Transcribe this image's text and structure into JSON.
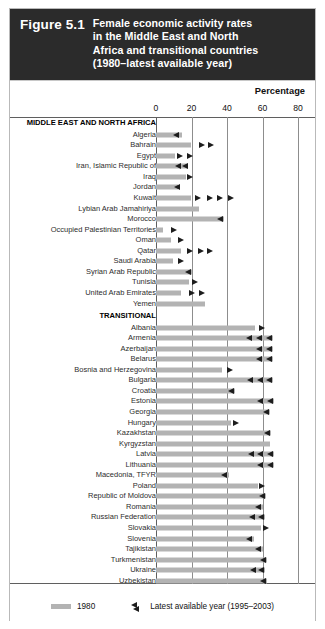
{
  "figure": {
    "number": "Figure 5.1",
    "title_lines": [
      "Female economic activity rates",
      "in the Middle East and North",
      "Africa and transitional countries",
      "(1980–latest available year)"
    ]
  },
  "axis": {
    "unit_label": "Percentage",
    "ticks": [
      "0",
      "20",
      "40",
      "60",
      "80"
    ]
  },
  "legend": {
    "bar_label": "1980",
    "marker_label": "Latest available year (1995–2003)"
  },
  "colors": {
    "header_bg": "#2b2b2b",
    "header_text": "#ffffff",
    "bar_1980": "#b3b3b3",
    "marker_latest": "#1d1d1d",
    "gridline": "#8d8d8d",
    "axis": "#5f5f5f",
    "page_bg": "#ffffff"
  },
  "chart_data": {
    "type": "bar",
    "title": "Female economic activity rates in the Middle East and North Africa and transitional countries (1980–latest available year)",
    "xlabel": "Percentage",
    "ylabel": "",
    "xlim": [
      0,
      80
    ],
    "xticks": [
      0,
      20,
      40,
      60,
      80
    ],
    "grid": true,
    "orientation": "horizontal",
    "legend_position": "bottom",
    "series": [
      {
        "name": "1980",
        "style": "bar",
        "color": "#b3b3b3"
      },
      {
        "name": "Latest available year (1995–2003)",
        "style": "triangle-marker",
        "color": "#1d1d1d"
      }
    ],
    "groups": [
      {
        "name": "MIDDLE EAST AND NORTH AFRICA",
        "rows": [
          {
            "label": "Algeria",
            "bar_1980": 14.5,
            "markers": [
              {
                "value": 13.0,
                "dir": "left"
              }
            ]
          },
          {
            "label": "Bahrain",
            "bar_1980": 19.5,
            "markers": [
              {
                "value": 24.0,
                "dir": "right"
              },
              {
                "value": 29.5,
                "dir": "right"
              }
            ]
          },
          {
            "label": "Egypt",
            "bar_1980": 10.5,
            "markers": [
              {
                "value": 12.0,
                "dir": "right"
              },
              {
                "value": 17.5,
                "dir": "right"
              }
            ]
          },
          {
            "label": "Iran, Islamic Republic of",
            "bar_1980": 18.0,
            "markers": [
              {
                "value": 14.5,
                "dir": "left"
              },
              {
                "value": 18.5,
                "dir": "left"
              }
            ]
          },
          {
            "label": "Iraq",
            "bar_1980": 17.0,
            "markers": [
              {
                "value": 17.5,
                "dir": "right"
              }
            ]
          },
          {
            "label": "Jordan",
            "bar_1980": 12.5,
            "markers": [
              {
                "value": 13.5,
                "dir": "left"
              }
            ]
          },
          {
            "label": "Kuwait",
            "bar_1980": 19.5,
            "markers": [
              {
                "value": 22.0,
                "dir": "right"
              },
              {
                "value": 28.5,
                "dir": "right"
              },
              {
                "value": 34.5,
                "dir": "right"
              },
              {
                "value": 40.5,
                "dir": "right"
              }
            ]
          },
          {
            "label": "Lybian Arab Jamahiriya",
            "bar_1980": 24.0,
            "markers": []
          },
          {
            "label": "Morocco",
            "bar_1980": 38.5,
            "markers": [
              {
                "value": 38.0,
                "dir": "left"
              }
            ]
          },
          {
            "label": "Occupied Palestinian Territories",
            "bar_1980": 4.0,
            "markers": [
              {
                "value": 8.5,
                "dir": "right"
              }
            ]
          },
          {
            "label": "Oman",
            "bar_1980": 8.5,
            "markers": [
              {
                "value": 12.5,
                "dir": "right"
              }
            ]
          },
          {
            "label": "Qatar",
            "bar_1980": 14.0,
            "markers": [
              {
                "value": 17.5,
                "dir": "right"
              },
              {
                "value": 23.5,
                "dir": "right"
              },
              {
                "value": 29.0,
                "dir": "right"
              }
            ]
          },
          {
            "label": "Saudi Arabia",
            "bar_1980": 9.5,
            "markers": [
              {
                "value": 12.5,
                "dir": "right"
              }
            ]
          },
          {
            "label": "Syrian Arab Republic",
            "bar_1980": 20.5,
            "markers": [
              {
                "value": 20.0,
                "dir": "left"
              }
            ]
          },
          {
            "label": "Tunisia",
            "bar_1980": 18.5,
            "markers": [
              {
                "value": 20.0,
                "dir": "right"
              }
            ]
          },
          {
            "label": "United Arab Emirates",
            "bar_1980": 14.0,
            "markers": [
              {
                "value": 18.5,
                "dir": "right"
              },
              {
                "value": 24.0,
                "dir": "right"
              }
            ]
          },
          {
            "label": "Yemen",
            "bar_1980": 27.5,
            "markers": []
          }
        ]
      },
      {
        "name": "TRANSITIONAL",
        "rows": [
          {
            "label": "Albania",
            "bar_1980": 56.0,
            "markers": [
              {
                "value": 58.0,
                "dir": "right"
              }
            ]
          },
          {
            "label": "Armenia",
            "bar_1980": 66.0,
            "markers": [
              {
                "value": 54.5,
                "dir": "left"
              },
              {
                "value": 60.0,
                "dir": "left"
              },
              {
                "value": 65.5,
                "dir": "left"
              }
            ]
          },
          {
            "label": "Azerbaijan",
            "bar_1980": 66.0,
            "markers": [
              {
                "value": 60.0,
                "dir": "left"
              },
              {
                "value": 65.5,
                "dir": "left"
              }
            ]
          },
          {
            "label": "Belarus",
            "bar_1980": 66.0,
            "markers": [
              {
                "value": 60.0,
                "dir": "left"
              },
              {
                "value": 65.5,
                "dir": "left"
              }
            ]
          },
          {
            "label": "Bosnia and Herzegovina",
            "bar_1980": 37.0,
            "markers": [
              {
                "value": 40.0,
                "dir": "right"
              }
            ]
          },
          {
            "label": "Bulgaria",
            "bar_1980": 66.0,
            "markers": [
              {
                "value": 55.0,
                "dir": "left"
              },
              {
                "value": 60.5,
                "dir": "left"
              },
              {
                "value": 65.5,
                "dir": "left"
              }
            ]
          },
          {
            "label": "Croatia",
            "bar_1980": 44.5,
            "markers": [
              {
                "value": 44.0,
                "dir": "left"
              }
            ]
          },
          {
            "label": "Estonia",
            "bar_1980": 66.5,
            "markers": [
              {
                "value": 60.5,
                "dir": "left"
              },
              {
                "value": 66.0,
                "dir": "left"
              }
            ]
          },
          {
            "label": "Georgia",
            "bar_1980": 64.5,
            "markers": [
              {
                "value": 64.0,
                "dir": "left"
              }
            ]
          },
          {
            "label": "Hungary",
            "bar_1980": 42.5,
            "markers": [
              {
                "value": 43.5,
                "dir": "right"
              }
            ]
          },
          {
            "label": "Kazakhstan",
            "bar_1980": 65.0,
            "markers": [
              {
                "value": 64.5,
                "dir": "left"
              }
            ]
          },
          {
            "label": "Kyrgyzstan",
            "bar_1980": 64.0,
            "markers": []
          },
          {
            "label": "Latvia",
            "bar_1980": 66.5,
            "markers": [
              {
                "value": 55.5,
                "dir": "left"
              },
              {
                "value": 60.5,
                "dir": "left"
              },
              {
                "value": 66.0,
                "dir": "left"
              }
            ]
          },
          {
            "label": "Lithuania",
            "bar_1980": 66.5,
            "markers": [
              {
                "value": 60.5,
                "dir": "left"
              },
              {
                "value": 66.0,
                "dir": "left"
              }
            ]
          },
          {
            "label": "Macedonia, TFYR",
            "bar_1980": 41.0,
            "markers": [
              {
                "value": 40.5,
                "dir": "left"
              }
            ]
          },
          {
            "label": "Poland",
            "bar_1980": 57.5,
            "markers": [
              {
                "value": 58.0,
                "dir": "right"
              }
            ]
          },
          {
            "label": "Republic of Moldova",
            "bar_1980": 62.0,
            "markers": [
              {
                "value": 61.5,
                "dir": "left"
              }
            ]
          },
          {
            "label": "Romania",
            "bar_1980": 60.0,
            "markers": [
              {
                "value": 59.5,
                "dir": "left"
              }
            ]
          },
          {
            "label": "Russian Federation",
            "bar_1980": 61.5,
            "markers": [
              {
                "value": 56.0,
                "dir": "left"
              },
              {
                "value": 61.0,
                "dir": "left"
              }
            ]
          },
          {
            "label": "Slovakia",
            "bar_1980": 59.0,
            "markers": [
              {
                "value": 60.5,
                "dir": "right"
              }
            ]
          },
          {
            "label": "Slovenia",
            "bar_1980": 55.0,
            "markers": [
              {
                "value": 54.5,
                "dir": "left"
              }
            ]
          },
          {
            "label": "Tajikistan",
            "bar_1980": 60.0,
            "markers": [
              {
                "value": 59.5,
                "dir": "left"
              }
            ]
          },
          {
            "label": "Turkmenistan",
            "bar_1980": 62.5,
            "markers": [
              {
                "value": 62.0,
                "dir": "left"
              }
            ]
          },
          {
            "label": "Ukraine",
            "bar_1980": 61.5,
            "markers": [
              {
                "value": 56.5,
                "dir": "left"
              },
              {
                "value": 61.0,
                "dir": "left"
              }
            ]
          },
          {
            "label": "Uzbekistan",
            "bar_1980": 62.5,
            "markers": [
              {
                "value": 62.0,
                "dir": "left"
              }
            ]
          }
        ]
      }
    ]
  }
}
